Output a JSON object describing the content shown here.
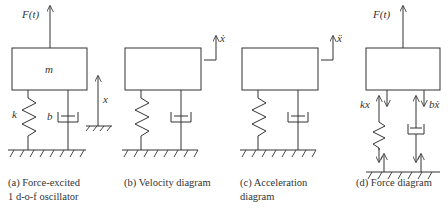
{
  "figure": {
    "panels": [
      {
        "id": "a",
        "caption_line1": "(a) Force-excited",
        "caption_line2": "1 d-o-f oscillator",
        "labels": {
          "force": "F(t)",
          "mass": "m",
          "spring": "k",
          "damper": "b",
          "displacement": "x"
        }
      },
      {
        "id": "b",
        "caption_line1": "(b) Velocity diagram",
        "labels": {
          "velocity": "ẋ"
        }
      },
      {
        "id": "c",
        "caption_line1": "(c) Acceleration",
        "caption_line2": "diagram",
        "labels": {
          "acceleration": "ẍ"
        }
      },
      {
        "id": "d",
        "caption_line1": "(d) Force diagram",
        "labels": {
          "force": "F(t)",
          "spring_force": "kx",
          "damper_force": "bẋ"
        }
      }
    ]
  },
  "colors": {
    "line": "#333333",
    "background": "#ffffff"
  }
}
